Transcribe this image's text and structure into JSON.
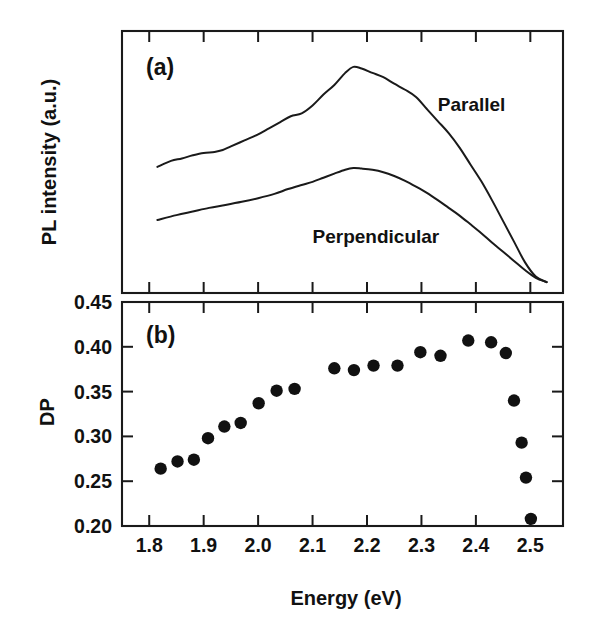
{
  "figure": {
    "background": "#ffffff",
    "ink_color": "#111111"
  },
  "chart_data": [
    {
      "id": "panel-a",
      "type": "line",
      "panel_label": "(a)",
      "title": "",
      "xlabel": "",
      "ylabel": "PL intensity (a.u.)",
      "xlim": [
        1.75,
        2.56
      ],
      "ylim": [
        0,
        1
      ],
      "grid": false,
      "legend_position": "inline-annotations",
      "x_ticks_major": [
        1.8,
        1.9,
        2.0,
        2.1,
        2.2,
        2.3,
        2.4,
        2.5
      ],
      "x_tick_labels_shown": false,
      "y_tick_labels_shown": false,
      "series": [
        {
          "name": "Parallel",
          "label_x": 2.33,
          "label_y": 0.72,
          "x": [
            1.815,
            1.84,
            1.86,
            1.88,
            1.9,
            1.92,
            1.935,
            1.95,
            1.975,
            2.0,
            2.02,
            2.04,
            2.06,
            2.08,
            2.1,
            2.12,
            2.14,
            2.16,
            2.175,
            2.19,
            2.21,
            2.23,
            2.25,
            2.27,
            2.29,
            2.31,
            2.33,
            2.35,
            2.37,
            2.39,
            2.41,
            2.43,
            2.45,
            2.47,
            2.49,
            2.51,
            2.53
          ],
          "y": [
            0.49,
            0.515,
            0.525,
            0.538,
            0.548,
            0.552,
            0.56,
            0.575,
            0.6,
            0.625,
            0.65,
            0.675,
            0.7,
            0.712,
            0.745,
            0.79,
            0.83,
            0.88,
            0.905,
            0.898,
            0.88,
            0.862,
            0.835,
            0.81,
            0.78,
            0.73,
            0.68,
            0.63,
            0.57,
            0.5,
            0.43,
            0.35,
            0.265,
            0.18,
            0.095,
            0.035,
            0.012
          ]
        },
        {
          "name": "Perpendicular",
          "label_x": 2.1,
          "label_y": 0.175,
          "x": [
            1.815,
            1.85,
            1.88,
            1.91,
            1.94,
            1.97,
            2.0,
            2.03,
            2.055,
            2.08,
            2.1,
            2.12,
            2.14,
            2.16,
            2.175,
            2.19,
            2.21,
            2.23,
            2.25,
            2.27,
            2.29,
            2.31,
            2.33,
            2.35,
            2.37,
            2.39,
            2.41,
            2.43,
            2.45,
            2.47,
            2.49,
            2.51,
            2.53
          ],
          "y": [
            0.27,
            0.29,
            0.305,
            0.32,
            0.332,
            0.345,
            0.36,
            0.378,
            0.398,
            0.415,
            0.428,
            0.445,
            0.462,
            0.478,
            0.485,
            0.483,
            0.478,
            0.468,
            0.452,
            0.432,
            0.408,
            0.382,
            0.352,
            0.32,
            0.288,
            0.252,
            0.215,
            0.175,
            0.138,
            0.1,
            0.062,
            0.03,
            0.012
          ]
        }
      ]
    },
    {
      "id": "panel-b",
      "type": "scatter",
      "panel_label": "(b)",
      "title": "",
      "xlabel": "Energy (eV)",
      "ylabel": "DP",
      "xlim": [
        1.75,
        2.56
      ],
      "ylim": [
        0.2,
        0.45
      ],
      "grid": false,
      "marker": "filled-circle",
      "marker_color": "#111111",
      "x_ticks": [
        1.8,
        1.9,
        2.0,
        2.1,
        2.2,
        2.3,
        2.4,
        2.5
      ],
      "x_tick_labels": [
        "1.8",
        "1.9",
        "2.0",
        "2.1",
        "2.2",
        "2.3",
        "2.4",
        "2.5"
      ],
      "y_ticks": [
        0.2,
        0.25,
        0.3,
        0.35,
        0.4,
        0.45
      ],
      "y_tick_labels": [
        "0.20",
        "0.25",
        "0.30",
        "0.35",
        "0.40",
        "0.45"
      ],
      "series": [
        {
          "name": "DP",
          "x": [
            1.821,
            1.852,
            1.882,
            1.908,
            1.938,
            1.968,
            2.001,
            2.034,
            2.067,
            2.14,
            2.176,
            2.212,
            2.256,
            2.298,
            2.335,
            2.386,
            2.428,
            2.455,
            2.47,
            2.484,
            2.492,
            2.501
          ],
          "y": [
            0.264,
            0.272,
            0.274,
            0.298,
            0.311,
            0.315,
            0.337,
            0.351,
            0.353,
            0.376,
            0.374,
            0.379,
            0.379,
            0.394,
            0.39,
            0.407,
            0.405,
            0.393,
            0.34,
            0.293,
            0.254,
            0.208
          ]
        }
      ]
    }
  ]
}
